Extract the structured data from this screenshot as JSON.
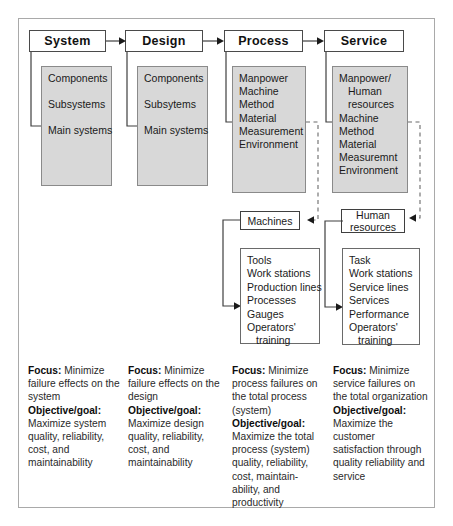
{
  "diagram": {
    "frame": {
      "border_color": "#a9a9a9"
    },
    "colors": {
      "panel_fill": "#d8d8d8",
      "panel_border": "#8a8a8a",
      "box_border": "#3f3f3f",
      "text": "#1a1a1a",
      "connector": "#3f3f3f"
    },
    "columns": [
      {
        "id": "system",
        "header": "System",
        "attributes": [
          "Components",
          "Subsystems",
          "Main systems"
        ],
        "focus_label": "Focus:",
        "focus_text": "Minimize failure  effects on the system",
        "objective_label": "Objective/goal:",
        "objective_text": "Maximize system quality, reliability, cost, and maintainability"
      },
      {
        "id": "design",
        "header": "Design",
        "attributes": [
          "Components",
          "Subsytems",
          "Main systems"
        ],
        "focus_label": "Focus:",
        "focus_text": "Minimize failure effects on the design",
        "objective_label": "Objective/goal:",
        "objective_text": "Maximize design quality, reliability, cost, and maintainability"
      },
      {
        "id": "process",
        "header": "Process",
        "attributes": [
          "Manpower",
          "Machine",
          "Method",
          "Material",
          "Measurement",
          "Environment"
        ],
        "focus_label": "Focus:",
        "focus_text": "Minimize process failures on the total process (system)",
        "objective_label": "Objective/goal:",
        "objective_text": "Maximize the total process (system) quality, reliability, cost, maintain-ability, and productivity",
        "sub_box": "Machines",
        "sub_items": [
          "Tools",
          "Work stations",
          "Production lines",
          "Processes",
          "Gauges",
          "Operators'",
          "training"
        ]
      },
      {
        "id": "service",
        "header": "Service",
        "attributes": [
          "Manpower/",
          "Human",
          "resources",
          "Machine",
          "Method",
          "Material",
          "Measuremnt",
          "Environment"
        ],
        "focus_label": "Focus:",
        "focus_text": "Minimize service failures on the total organization",
        "objective_label": "Objective/goal:",
        "objective_text": "Maximize the customer satisfaction through quality reliability and service",
        "sub_box_line1": "Human",
        "sub_box_line2": "resources",
        "sub_items": [
          "Task",
          "Work stations",
          "Service lines",
          "Services",
          "Performance",
          "Operators'",
          "training"
        ]
      }
    ]
  }
}
